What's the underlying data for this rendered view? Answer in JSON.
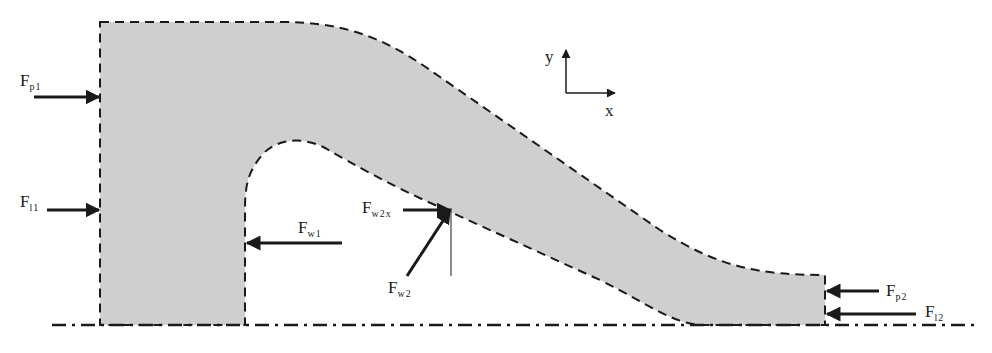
{
  "diagram": {
    "colors": {
      "control_volume_fill": "#cfcfcf",
      "outline": "#1a1a1a",
      "background": "#ffffff"
    },
    "axes": {
      "y_label": "y",
      "x_label": "x"
    },
    "forces": {
      "fp1": {
        "main": "F",
        "sub": "p1",
        "direction": "right"
      },
      "fl1": {
        "main": "F",
        "sub": "l1",
        "direction": "right"
      },
      "fw1": {
        "main": "F",
        "sub": "w1",
        "direction": "left"
      },
      "fw2x": {
        "main": "F",
        "sub": "w2x",
        "direction": "right"
      },
      "fw2": {
        "main": "F",
        "sub": "w2",
        "direction": "up-right"
      },
      "fp2": {
        "main": "F",
        "sub": "p2",
        "direction": "left"
      },
      "fl2": {
        "main": "F",
        "sub": "l2",
        "direction": "left"
      }
    },
    "baseline": "dash-dot centerline"
  }
}
